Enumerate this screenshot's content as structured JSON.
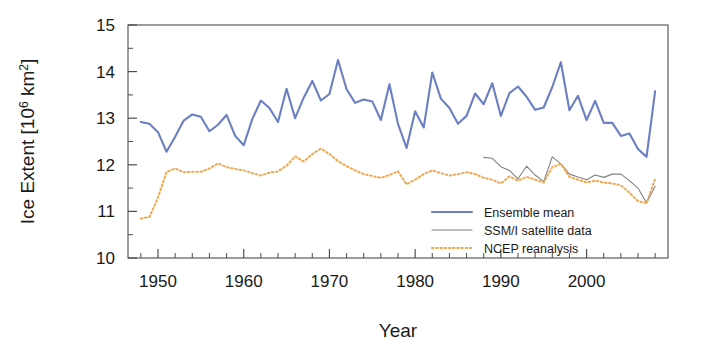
{
  "chart_data": {
    "type": "line",
    "title": "",
    "xlabel": "Year",
    "ylabel": "Ice Extent [10⁶ km²]",
    "ylabel_parts": {
      "main": "Ice Extent [10",
      "exp1": "6",
      "mid": " km",
      "exp2": "2",
      "end": "]"
    },
    "xlim": [
      1946.5,
      2009.5
    ],
    "ylim": [
      10,
      15
    ],
    "yticks": [
      10,
      11,
      12,
      13,
      14,
      15
    ],
    "ytick_labels": [
      "10",
      "11",
      "12",
      "13",
      "14",
      "15"
    ],
    "xticks": [
      1950,
      1960,
      1970,
      1980,
      1990,
      2000
    ],
    "xtick_labels": [
      "1950",
      "1960",
      "1970",
      "1980",
      "1990",
      "2000"
    ],
    "x_minor_step": 2,
    "grid": false,
    "legend_position": "lower-right",
    "series": [
      {
        "name": "Ensemble mean",
        "color": "#6b7fc2",
        "style": "solid",
        "width": 2.1,
        "x": [
          1948,
          1949,
          1950,
          1951,
          1952,
          1953,
          1954,
          1955,
          1956,
          1957,
          1958,
          1959,
          1960,
          1961,
          1962,
          1963,
          1964,
          1965,
          1966,
          1967,
          1968,
          1969,
          1970,
          1971,
          1972,
          1973,
          1974,
          1975,
          1976,
          1977,
          1978,
          1979,
          1980,
          1981,
          1982,
          1983,
          1984,
          1985,
          1986,
          1987,
          1988,
          1989,
          1990,
          1991,
          1992,
          1993,
          1994,
          1995,
          1996,
          1997,
          1998,
          1999,
          2000,
          2001,
          2002,
          2003,
          2004,
          2005,
          2006,
          2007,
          2008
        ],
        "y": [
          12.92,
          12.88,
          12.7,
          12.28,
          12.6,
          12.95,
          13.08,
          13.03,
          12.72,
          12.86,
          13.07,
          12.62,
          12.42,
          12.98,
          13.38,
          13.22,
          12.92,
          13.63,
          13.0,
          13.44,
          13.8,
          13.38,
          13.52,
          14.25,
          13.62,
          13.33,
          13.4,
          13.36,
          12.96,
          13.73,
          12.88,
          12.36,
          13.15,
          12.8,
          13.98,
          13.42,
          13.22,
          12.88,
          13.05,
          13.53,
          13.3,
          13.75,
          13.05,
          13.54,
          13.68,
          13.46,
          13.18,
          13.23,
          13.67,
          14.2,
          13.17,
          13.48,
          12.96,
          13.37,
          12.9,
          12.9,
          12.62,
          12.67,
          12.34,
          12.17,
          13.58
        ]
      },
      {
        "name": "SSM/I satellite data",
        "color": "#808080",
        "style": "solid",
        "width": 1.1,
        "x": [
          1988,
          1989,
          1990,
          1991,
          1992,
          1993,
          1994,
          1995,
          1996,
          1997,
          1998,
          1999,
          2000,
          2001,
          2002,
          2003,
          2004,
          2005,
          2006,
          2007,
          2008
        ],
        "y": [
          12.16,
          12.14,
          11.96,
          11.88,
          11.7,
          11.97,
          11.78,
          11.64,
          12.17,
          12.02,
          11.8,
          11.74,
          11.68,
          11.78,
          11.73,
          11.8,
          11.8,
          11.66,
          11.5,
          11.18,
          11.54
        ]
      },
      {
        "name": "NCEP reanalysis",
        "color": "#f0a850",
        "style": "dotted",
        "width": 2.0,
        "x": [
          1948,
          1949,
          1950,
          1951,
          1952,
          1953,
          1954,
          1955,
          1956,
          1957,
          1958,
          1959,
          1960,
          1961,
          1962,
          1963,
          1964,
          1965,
          1966,
          1967,
          1968,
          1969,
          1970,
          1971,
          1972,
          1973,
          1974,
          1975,
          1976,
          1977,
          1978,
          1979,
          1980,
          1981,
          1982,
          1983,
          1984,
          1985,
          1986,
          1987,
          1988,
          1989,
          1990,
          1991,
          1992,
          1993,
          1994,
          1995,
          1996,
          1997,
          1998,
          1999,
          2000,
          2001,
          2002,
          2003,
          2004,
          2005,
          2006,
          2007,
          2008
        ],
        "y": [
          10.85,
          10.88,
          11.3,
          11.85,
          11.92,
          11.84,
          11.85,
          11.85,
          11.92,
          12.03,
          11.95,
          11.91,
          11.88,
          11.82,
          11.77,
          11.83,
          11.86,
          11.98,
          12.18,
          12.07,
          12.23,
          12.35,
          12.23,
          12.08,
          11.97,
          11.88,
          11.8,
          11.76,
          11.72,
          11.78,
          11.86,
          11.58,
          11.68,
          11.8,
          11.88,
          11.82,
          11.77,
          11.8,
          11.84,
          11.8,
          11.72,
          11.68,
          11.6,
          11.75,
          11.66,
          11.74,
          11.68,
          11.62,
          11.95,
          12.02,
          11.74,
          11.68,
          11.62,
          11.66,
          11.62,
          11.6,
          11.56,
          11.4,
          11.22,
          11.18,
          11.7
        ]
      }
    ]
  },
  "legend": {
    "items": [
      {
        "label": "Ensemble mean",
        "color": "#6b7fc2",
        "style": "solid",
        "width": 2.1
      },
      {
        "label": "SSM/I satellite data",
        "color": "#808080",
        "style": "solid",
        "width": 1.1
      },
      {
        "label": "NCEP reanalysis",
        "color": "#f0a850",
        "style": "dotted",
        "width": 2.0
      }
    ]
  }
}
